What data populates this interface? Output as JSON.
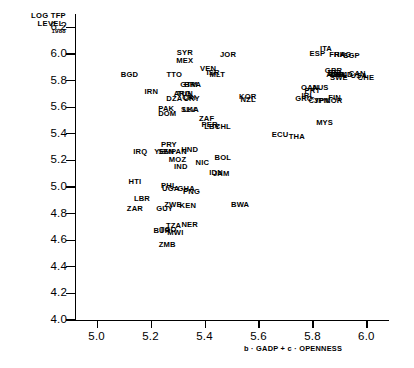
{
  "chart_data": {
    "type": "scatter",
    "title": "",
    "ylabel": "LOG TFP LEVEL, 1988",
    "ylabel_lines": [
      "LOG TFP",
      "LEVEL,",
      "1988"
    ],
    "xlabel": "b · GADP + c · OPENNESS",
    "xlim": [
      4.92,
      6.08
    ],
    "ylim": [
      4.0,
      6.3
    ],
    "yticks": [
      4.0,
      4.2,
      4.4,
      4.6,
      4.8,
      5.0,
      5.2,
      5.4,
      5.6,
      5.8,
      6.0,
      6.2
    ],
    "ytick_labels": [
      "4.0",
      "4.2",
      "4.4",
      "4.6",
      "4.8",
      "5.0",
      "5.2",
      "5.4",
      "5.6",
      "5.8",
      "6.0",
      "6.2"
    ],
    "xticks": [
      5.0,
      5.2,
      5.4,
      5.6,
      5.8,
      6.0
    ],
    "xtick_labels": [
      "5.0",
      "5.2",
      "5.4",
      "5.6",
      "5.8",
      "6.0"
    ],
    "grid": false,
    "legend": false,
    "marker": "text-label",
    "points": [
      {
        "label": "SYR",
        "x": 5.327,
        "y": 6.005
      },
      {
        "label": "JOR",
        "x": 5.487,
        "y": 5.99
      },
      {
        "label": "ITA",
        "x": 5.85,
        "y": 6.035
      },
      {
        "label": "ESP",
        "x": 5.818,
        "y": 6.0
      },
      {
        "label": "FRA",
        "x": 5.892,
        "y": 5.995
      },
      {
        "label": "HKG",
        "x": 5.912,
        "y": 5.995
      },
      {
        "label": "SGP",
        "x": 5.945,
        "y": 5.982
      },
      {
        "label": "MEX",
        "x": 5.327,
        "y": 5.945
      },
      {
        "label": "VEN",
        "x": 5.413,
        "y": 5.885
      },
      {
        "label": "BGD",
        "x": 5.122,
        "y": 5.838
      },
      {
        "label": "TTO",
        "x": 5.288,
        "y": 5.845
      },
      {
        "label": "ISR",
        "x": 5.432,
        "y": 5.855
      },
      {
        "label": "MLT",
        "x": 5.447,
        "y": 5.838
      },
      {
        "label": "GBR",
        "x": 5.878,
        "y": 5.872
      },
      {
        "label": "BEL",
        "x": 5.886,
        "y": 5.86
      },
      {
        "label": "AUT",
        "x": 5.881,
        "y": 5.845
      },
      {
        "label": "DNK",
        "x": 5.896,
        "y": 5.843
      },
      {
        "label": "DEU",
        "x": 5.898,
        "y": 5.838
      },
      {
        "label": "NLD",
        "x": 5.919,
        "y": 5.838
      },
      {
        "label": "CAN",
        "x": 5.966,
        "y": 5.852
      },
      {
        "label": "USA",
        "x": 5.972,
        "y": 5.835
      },
      {
        "label": "CHE",
        "x": 5.998,
        "y": 5.822
      },
      {
        "label": "SWE",
        "x": 5.898,
        "y": 5.818
      },
      {
        "label": "GTM",
        "x": 5.342,
        "y": 5.768
      },
      {
        "label": "BRA",
        "x": 5.356,
        "y": 5.768
      },
      {
        "label": "IRN",
        "x": 5.203,
        "y": 5.712
      },
      {
        "label": "ARG",
        "x": 5.318,
        "y": 5.695
      },
      {
        "label": "TUN",
        "x": 5.327,
        "y": 5.695
      },
      {
        "label": "OAN",
        "x": 5.79,
        "y": 5.742
      },
      {
        "label": "AUS",
        "x": 5.829,
        "y": 5.742
      },
      {
        "label": "PRT",
        "x": 5.8,
        "y": 5.722
      },
      {
        "label": "DZA",
        "x": 5.288,
        "y": 5.662
      },
      {
        "label": "CRI",
        "x": 5.343,
        "y": 5.665
      },
      {
        "label": "URY",
        "x": 5.352,
        "y": 5.658
      },
      {
        "label": "KOR",
        "x": 5.56,
        "y": 5.678
      },
      {
        "label": "IRL",
        "x": 5.783,
        "y": 5.682
      },
      {
        "label": "GRC",
        "x": 5.768,
        "y": 5.66
      },
      {
        "label": "CYP",
        "x": 5.815,
        "y": 5.648
      },
      {
        "label": "JPN",
        "x": 5.834,
        "y": 5.648
      },
      {
        "label": "FIN",
        "x": 5.882,
        "y": 5.668
      },
      {
        "label": "NOR",
        "x": 5.879,
        "y": 5.648
      },
      {
        "label": "PAK",
        "x": 5.258,
        "y": 5.588
      },
      {
        "label": "SLV",
        "x": 5.34,
        "y": 5.575
      },
      {
        "label": "LKA",
        "x": 5.349,
        "y": 5.575
      },
      {
        "label": "NZL",
        "x": 5.562,
        "y": 5.652
      },
      {
        "label": "DOM",
        "x": 5.262,
        "y": 5.548
      },
      {
        "label": "ZAF",
        "x": 5.408,
        "y": 5.508
      },
      {
        "label": "MYS",
        "x": 5.845,
        "y": 5.478
      },
      {
        "label": "PER",
        "x": 5.419,
        "y": 5.462
      },
      {
        "label": "LBY",
        "x": 5.428,
        "y": 5.448
      },
      {
        "label": "CHL",
        "x": 5.468,
        "y": 5.452
      },
      {
        "label": "PRY",
        "x": 5.268,
        "y": 5.318
      },
      {
        "label": "ECU",
        "x": 5.68,
        "y": 5.392
      },
      {
        "label": "THA",
        "x": 5.742,
        "y": 5.378
      },
      {
        "label": "IRQ",
        "x": 5.162,
        "y": 5.265
      },
      {
        "label": "YEM",
        "x": 5.245,
        "y": 5.262
      },
      {
        "label": "SEN",
        "x": 5.258,
        "y": 5.262
      },
      {
        "label": "PAN",
        "x": 5.305,
        "y": 5.262
      },
      {
        "label": "HND",
        "x": 5.345,
        "y": 5.278
      },
      {
        "label": "BOL",
        "x": 5.468,
        "y": 5.215
      },
      {
        "label": "MOZ",
        "x": 5.3,
        "y": 5.205
      },
      {
        "label": "NIC",
        "x": 5.392,
        "y": 5.182
      },
      {
        "label": "IND",
        "x": 5.312,
        "y": 5.148
      },
      {
        "label": "IDN",
        "x": 5.443,
        "y": 5.108
      },
      {
        "label": "JAM",
        "x": 5.462,
        "y": 5.098
      },
      {
        "label": "HTI",
        "x": 5.142,
        "y": 5.038
      },
      {
        "label": "PHL",
        "x": 5.268,
        "y": 5.005
      },
      {
        "label": "UGA",
        "x": 5.275,
        "y": 4.985
      },
      {
        "label": "GHA",
        "x": 5.332,
        "y": 4.982
      },
      {
        "label": "PNG",
        "x": 5.352,
        "y": 4.962
      },
      {
        "label": "LBR",
        "x": 5.168,
        "y": 4.908
      },
      {
        "label": "ZWE",
        "x": 5.283,
        "y": 4.862
      },
      {
        "label": "KEN",
        "x": 5.338,
        "y": 4.858
      },
      {
        "label": "BWA",
        "x": 5.532,
        "y": 4.868
      },
      {
        "label": "ZAR",
        "x": 5.142,
        "y": 4.832
      },
      {
        "label": "GUY",
        "x": 5.252,
        "y": 4.832
      },
      {
        "label": "TZA",
        "x": 5.285,
        "y": 4.705
      },
      {
        "label": "NER",
        "x": 5.345,
        "y": 4.715
      },
      {
        "label": "BUR",
        "x": 5.242,
        "y": 4.672
      },
      {
        "label": "TGO",
        "x": 5.265,
        "y": 4.675
      },
      {
        "label": "MWI",
        "x": 5.292,
        "y": 4.655
      },
      {
        "label": "ZMB",
        "x": 5.262,
        "y": 4.565
      }
    ]
  }
}
